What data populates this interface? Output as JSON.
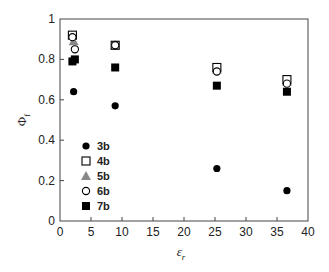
{
  "chart_data": {
    "type": "scatter",
    "title": "",
    "xlabel": "ε",
    "xlabel_sub": "r",
    "ylabel": "Φ",
    "ylabel_sub": "f",
    "xlim": [
      0,
      40
    ],
    "ylim": [
      0,
      1
    ],
    "xticks": [
      0,
      5,
      10,
      15,
      20,
      25,
      30,
      35,
      40
    ],
    "yticks": [
      0,
      0.2,
      0.4,
      0.6,
      0.8,
      1
    ],
    "ytick_labels": [
      "0",
      "0.2",
      "0.4",
      "0.6",
      "0.8",
      "1"
    ],
    "grid": false,
    "legend_position": "lower left (inside)",
    "series": [
      {
        "name": "3b",
        "marker": "filled-circle",
        "color": "#000000",
        "points": [
          [
            2.2,
            0.64
          ],
          [
            8.9,
            0.57
          ],
          [
            25.3,
            0.26
          ],
          [
            36.6,
            0.15
          ]
        ]
      },
      {
        "name": "4b",
        "marker": "open-square",
        "color": "#000000",
        "points": [
          [
            2.0,
            0.92
          ],
          [
            8.9,
            0.87
          ],
          [
            25.3,
            0.76
          ],
          [
            36.6,
            0.7
          ]
        ]
      },
      {
        "name": "5b",
        "marker": "gray-triangle",
        "color": "#888888",
        "points": [
          [
            2.2,
            0.89
          ],
          [
            8.9,
            0.87
          ],
          [
            25.3,
            0.75
          ],
          [
            36.6,
            0.69
          ]
        ]
      },
      {
        "name": "6b",
        "marker": "open-circle",
        "color": "#000000",
        "points": [
          [
            2.0,
            0.91
          ],
          [
            2.4,
            0.85
          ],
          [
            8.9,
            0.87
          ],
          [
            25.3,
            0.74
          ],
          [
            36.6,
            0.68
          ]
        ]
      },
      {
        "name": "7b",
        "marker": "filled-square",
        "color": "#000000",
        "points": [
          [
            2.0,
            0.79
          ],
          [
            2.4,
            0.8
          ],
          [
            8.9,
            0.76
          ],
          [
            25.3,
            0.67
          ],
          [
            36.6,
            0.64
          ]
        ]
      }
    ]
  }
}
